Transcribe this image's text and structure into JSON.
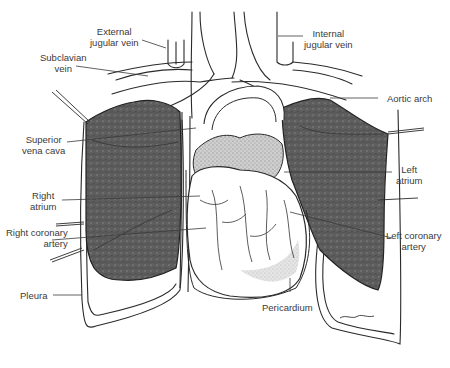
{
  "figure": {
    "colors": {
      "line": "#2a2a2a",
      "lung_fill": "#5a5a5a",
      "stipple": "#9a9a9a",
      "label": "#3a3a3a",
      "background": "#ffffff"
    },
    "labels": {
      "external_jugular_vein": {
        "line1": "External",
        "line2": "jugular vein"
      },
      "internal_jugular_vein": {
        "line1": "Internal",
        "line2": "jugular vein"
      },
      "subclavian_vein": {
        "line1": "Subclavian",
        "line2": "vein"
      },
      "aortic_arch": {
        "line1": "Aortic arch"
      },
      "superior_vena_cava": {
        "line1": "Superior",
        "line2": "vena cava"
      },
      "left_atrium": {
        "line1": "Left",
        "line2": "atrium"
      },
      "right_atrium": {
        "line1": "Right",
        "line2": "atrium"
      },
      "right_coronary_artery": {
        "line1": "Right coronary",
        "line2": "artery"
      },
      "left_coronary_artery": {
        "line1": "Left coronary",
        "line2": "artery"
      },
      "pleura": {
        "line1": "Pleura"
      },
      "pericardium": {
        "line1": "Pericardium"
      }
    }
  }
}
